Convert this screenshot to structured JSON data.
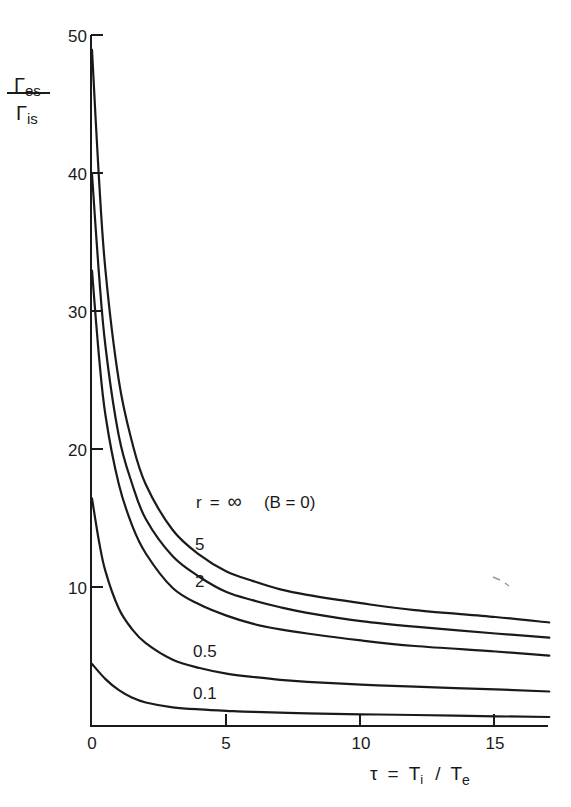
{
  "chart_data": {
    "type": "line",
    "title": "",
    "xlabel": "τ = T_i / T_e",
    "ylabel": "Γ_es / Γ_is",
    "xlim": [
      0,
      17
    ],
    "ylim": [
      0,
      50
    ],
    "grid": false,
    "x_ticks": [
      0,
      5,
      10,
      15
    ],
    "y_ticks": [
      10,
      20,
      30,
      40,
      50
    ],
    "x_tick_labels": [
      "0",
      "5",
      "10",
      "15"
    ],
    "y_tick_labels": [
      "10",
      "20",
      "30",
      "40",
      "50"
    ],
    "annotations": [
      "r = ∞  (B = 0)",
      "5",
      "2",
      "0.5",
      "0.1"
    ],
    "series": [
      {
        "name": "r = ∞ (B = 0)",
        "label": "r = ∞  (B = 0)",
        "x": [
          0,
          0.25,
          0.5,
          1,
          1.5,
          2,
          3,
          4,
          5,
          6,
          7,
          8,
          10,
          12,
          15,
          17
        ],
        "y": [
          49,
          40,
          33,
          25,
          20.5,
          17.5,
          14.2,
          12.4,
          11.2,
          10.5,
          9.9,
          9.5,
          8.9,
          8.4,
          7.9,
          7.5
        ]
      },
      {
        "name": "r = 5",
        "label": "5",
        "x": [
          0,
          0.25,
          0.5,
          1,
          1.5,
          2,
          3,
          4,
          5,
          6,
          7,
          8,
          10,
          12,
          15,
          17
        ],
        "y": [
          40,
          33,
          27.5,
          21,
          17.5,
          15,
          12.3,
          10.8,
          9.7,
          9.1,
          8.6,
          8.2,
          7.6,
          7.2,
          6.7,
          6.4
        ]
      },
      {
        "name": "r = 2",
        "label": "2",
        "x": [
          0,
          0.25,
          0.5,
          1,
          1.5,
          2,
          3,
          4,
          5,
          6,
          7,
          8,
          10,
          12,
          15,
          17
        ],
        "y": [
          33,
          27,
          22.5,
          17.5,
          14.5,
          12.5,
          10,
          8.8,
          8,
          7.4,
          7,
          6.7,
          6.2,
          5.8,
          5.4,
          5.1
        ]
      },
      {
        "name": "r = 0.5",
        "label": "0.5",
        "x": [
          0,
          0.25,
          0.5,
          1,
          1.5,
          2,
          3,
          4,
          5,
          6,
          7,
          8,
          10,
          12,
          15,
          17
        ],
        "y": [
          16.5,
          13.5,
          11.2,
          8.5,
          7,
          6,
          4.8,
          4.2,
          3.8,
          3.55,
          3.35,
          3.2,
          3,
          2.85,
          2.65,
          2.5
        ]
      },
      {
        "name": "r = 0.1",
        "label": "0.1",
        "x": [
          0,
          0.5,
          1,
          1.5,
          2,
          3,
          4,
          5,
          6,
          8,
          10,
          12,
          15,
          17
        ],
        "y": [
          4.5,
          3.4,
          2.6,
          2.05,
          1.7,
          1.35,
          1.2,
          1.1,
          1.02,
          0.92,
          0.85,
          0.8,
          0.7,
          0.65
        ]
      }
    ]
  },
  "labels": {
    "y_axis_numerator": "Γ",
    "y_axis_numerator_sub": "es",
    "y_axis_denominator": "Γ",
    "y_axis_denominator_sub": "is",
    "x_axis_tau": "τ",
    "x_axis_eq": "=",
    "x_axis_Ti": "T",
    "x_axis_Ti_sub": "i",
    "x_axis_slash": "/",
    "x_axis_Te": "T",
    "x_axis_Te_sub": "e",
    "curve_inf_r": "r",
    "curve_inf_eq": "=",
    "curve_inf_sym": "∞",
    "curve_inf_b": "(B = 0)",
    "curve_5": "5",
    "curve_2": "2",
    "curve_05": "0.5",
    "curve_01": "0.1"
  },
  "ticks": {
    "x0": "0",
    "x5": "5",
    "x10": "10",
    "x15": "15",
    "y10": "10",
    "y20": "20",
    "y30": "30",
    "y40": "40",
    "y50": "50"
  }
}
